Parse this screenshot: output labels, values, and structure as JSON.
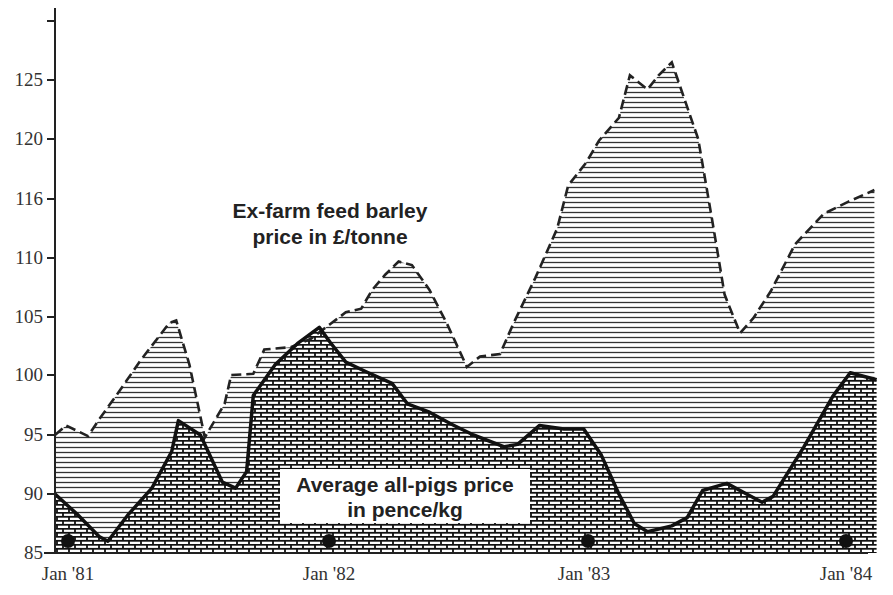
{
  "chart_data": {
    "type": "area",
    "title": "",
    "xlabel": "",
    "ylabel": "",
    "x_ticks": [
      "Jan '81",
      "Jan '82",
      "Jan '83",
      "Jan '84"
    ],
    "y_ticks": [
      85,
      90,
      95,
      100,
      105,
      110,
      116,
      120,
      125
    ],
    "y_tick_positions_note": "labels are evenly spaced on the axis",
    "ylim": [
      85,
      130
    ],
    "grid": false,
    "series": [
      {
        "name": "Ex-farm feed barley price in £/tonne",
        "style": "dashed line, horizontal line hatch fill",
        "points": [
          [
            0,
            95.0
          ],
          [
            0.5,
            95.8
          ],
          [
            1.5,
            94.9
          ],
          [
            2,
            96.3
          ],
          [
            2.9,
            98.6
          ],
          [
            3.9,
            101.3
          ],
          [
            5.2,
            104.5
          ],
          [
            5.5,
            104.7
          ],
          [
            6.1,
            100.9
          ],
          [
            6.8,
            94.8
          ],
          [
            7.7,
            97.6
          ],
          [
            8.0,
            100.0
          ],
          [
            9.0,
            100.1
          ],
          [
            9.5,
            102.2
          ],
          [
            10.7,
            102.4
          ],
          [
            11.6,
            103.1
          ],
          [
            12.5,
            104.4
          ],
          [
            13.2,
            105.4
          ],
          [
            13.9,
            105.7
          ],
          [
            14.4,
            107.3
          ],
          [
            15.0,
            108.6
          ],
          [
            15.6,
            109.7
          ],
          [
            16.2,
            109.4
          ],
          [
            17.0,
            107.3
          ],
          [
            17.8,
            104.4
          ],
          [
            18.7,
            100.7
          ],
          [
            19.3,
            101.6
          ],
          [
            20.2,
            101.8
          ],
          [
            20.8,
            104.4
          ],
          [
            21.8,
            108.3
          ],
          [
            22.8,
            113.0
          ],
          [
            23.3,
            116.9
          ],
          [
            24.1,
            118.4
          ],
          [
            24.7,
            119.9
          ],
          [
            25.6,
            121.8
          ],
          [
            26.1,
            125.4
          ],
          [
            26.9,
            124.2
          ],
          [
            27.4,
            125.4
          ],
          [
            28.0,
            126.5
          ],
          [
            29.2,
            120.0
          ],
          [
            29.9,
            113.0
          ],
          [
            30.4,
            106.9
          ],
          [
            31.1,
            103.6
          ],
          [
            31.7,
            104.9
          ],
          [
            32.5,
            107.2
          ],
          [
            33.6,
            111.4
          ],
          [
            34.9,
            114.5
          ],
          [
            36.0,
            115.7
          ],
          [
            37.2,
            116.6
          ]
        ]
      },
      {
        "name": "Average all-pigs price in pence/kg",
        "style": "solid line, brick/cross-hatch fill",
        "points": [
          [
            0,
            90.0
          ],
          [
            1.0,
            88.3
          ],
          [
            2.0,
            86.4
          ],
          [
            2.4,
            86.0
          ],
          [
            3.3,
            88.2
          ],
          [
            4.4,
            90.5
          ],
          [
            5.3,
            93.6
          ],
          [
            5.6,
            96.2
          ],
          [
            6.6,
            95.0
          ],
          [
            7.6,
            91.0
          ],
          [
            8.2,
            90.5
          ],
          [
            8.7,
            91.9
          ],
          [
            9.0,
            98.3
          ],
          [
            10.0,
            100.9
          ],
          [
            11.0,
            102.7
          ],
          [
            12.0,
            104.1
          ],
          [
            12.5,
            102.8
          ],
          [
            13.2,
            101.1
          ],
          [
            14.1,
            100.3
          ],
          [
            15.3,
            99.3
          ],
          [
            16.0,
            97.6
          ],
          [
            17.0,
            96.9
          ],
          [
            18.0,
            95.9
          ],
          [
            19.0,
            95.0
          ],
          [
            20.4,
            94.0
          ],
          [
            21.0,
            94.2
          ],
          [
            22.0,
            95.8
          ],
          [
            23.1,
            95.5
          ],
          [
            24.0,
            95.5
          ],
          [
            24.8,
            93.3
          ],
          [
            25.6,
            90.0
          ],
          [
            26.3,
            87.5
          ],
          [
            26.9,
            86.8
          ],
          [
            28.0,
            87.3
          ],
          [
            28.7,
            88.0
          ],
          [
            29.4,
            90.3
          ],
          [
            30.5,
            90.9
          ],
          [
            31.5,
            89.9
          ],
          [
            32.1,
            89.3
          ],
          [
            32.6,
            89.8
          ],
          [
            34.0,
            94.0
          ],
          [
            35.3,
            98.2
          ],
          [
            36.1,
            100.2
          ],
          [
            37.3,
            99.6
          ]
        ]
      }
    ],
    "annotations": [
      {
        "text": "Ex-farm feed barley",
        "line": 1
      },
      {
        "text": "price in £/tonne",
        "line": 2
      },
      {
        "text": "Average all-pigs price",
        "line": 1
      },
      {
        "text": "in pence/kg",
        "line": 2
      }
    ]
  },
  "labels": {
    "barley_line1": "Ex-farm feed barley",
    "barley_line2": "price in £/tonne",
    "pigs_line1": "Average all-pigs price",
    "pigs_line2": "in pence/kg",
    "x0": "Jan '81",
    "x1": "Jan '82",
    "x2": "Jan '83",
    "x3": "Jan '84",
    "y0": "85",
    "y1": "90",
    "y2": "95",
    "y3": "100",
    "y4": "105",
    "y5": "110",
    "y6": "116",
    "y7": "120",
    "y8": "125"
  }
}
